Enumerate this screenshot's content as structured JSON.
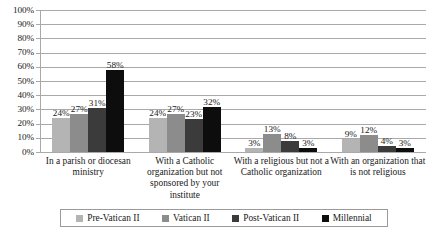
{
  "chart_data": {
    "type": "bar",
    "title": "",
    "subtitle": "",
    "xlabel": "",
    "ylabel": "",
    "ylim": [
      0,
      100
    ],
    "ytick_labels": [
      "100%",
      "90%",
      "80%",
      "70%",
      "60%",
      "50%",
      "40%",
      "30%",
      "20%",
      "10%",
      "0%"
    ],
    "ytick_values": [
      100,
      90,
      80,
      70,
      60,
      50,
      40,
      30,
      20,
      10,
      0
    ],
    "grid": true,
    "legend_position": "bottom",
    "categories": [
      "In a parish or diocesan ministry",
      "With a Catholic organization but not sponsored by your institute",
      "With a religious but not a Catholic organization",
      "With an organization that is not religious"
    ],
    "series": [
      {
        "name": "Pre-Vatican II",
        "color": "#b4b4b4",
        "values": [
          24,
          24,
          3,
          9
        ],
        "labels": [
          "24%",
          "24%",
          "3%",
          "9%"
        ]
      },
      {
        "name": "Vatican II",
        "color": "#8c8c8c",
        "values": [
          27,
          27,
          13,
          12
        ],
        "labels": [
          "27%",
          "27%",
          "13%",
          "12%"
        ]
      },
      {
        "name": "Post-Vatican II",
        "color": "#3b3b3b",
        "values": [
          31,
          23,
          8,
          4
        ],
        "labels": [
          "31%",
          "23%",
          "8%",
          "4%"
        ]
      },
      {
        "name": "Millennial",
        "color": "#0d0d0d",
        "values": [
          58,
          32,
          3,
          3
        ],
        "labels": [
          "58%",
          "32%",
          "3%",
          "3%"
        ]
      }
    ]
  }
}
